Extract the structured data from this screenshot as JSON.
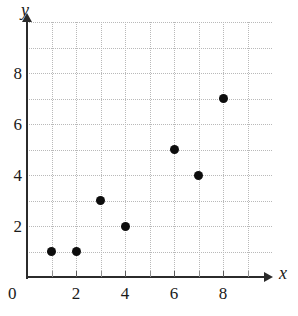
{
  "chart_data": {
    "type": "scatter",
    "title": "",
    "subtitle": "",
    "xlabel": "x",
    "ylabel": "y",
    "origin_label": "0",
    "xlim": [
      0,
      10
    ],
    "ylim": [
      0,
      10
    ],
    "grid": true,
    "grid_step": 1,
    "legend": null,
    "legend_position": "none",
    "x_tick_labels": [
      {
        "value": 2,
        "text": "2"
      },
      {
        "value": 4,
        "text": "4"
      },
      {
        "value": 6,
        "text": "6"
      },
      {
        "value": 8,
        "text": "8"
      }
    ],
    "y_tick_labels": [
      {
        "value": 2,
        "text": "2"
      },
      {
        "value": 4,
        "text": "4"
      },
      {
        "value": 6,
        "text": "6"
      },
      {
        "value": 8,
        "text": "8"
      }
    ],
    "x_minor_ticks": [
      1,
      2,
      3,
      4,
      5,
      6,
      7,
      8,
      9
    ],
    "points": [
      {
        "x": 1,
        "y": 1
      },
      {
        "x": 2,
        "y": 1
      },
      {
        "x": 3,
        "y": 3
      },
      {
        "x": 4,
        "y": 2
      },
      {
        "x": 6,
        "y": 5
      },
      {
        "x": 7,
        "y": 4
      },
      {
        "x": 8,
        "y": 7
      }
    ],
    "series": [
      {
        "name": "",
        "x": [
          1,
          2,
          3,
          4,
          6,
          7,
          8
        ],
        "values": [
          1,
          1,
          3,
          2,
          5,
          4,
          7
        ]
      }
    ],
    "colors": {
      "point": "#0d0d0d",
      "axis": "#2b2b2b",
      "gridline": "#b9b9b9",
      "text": "#1a1a1a",
      "background": "#ffffff"
    }
  }
}
